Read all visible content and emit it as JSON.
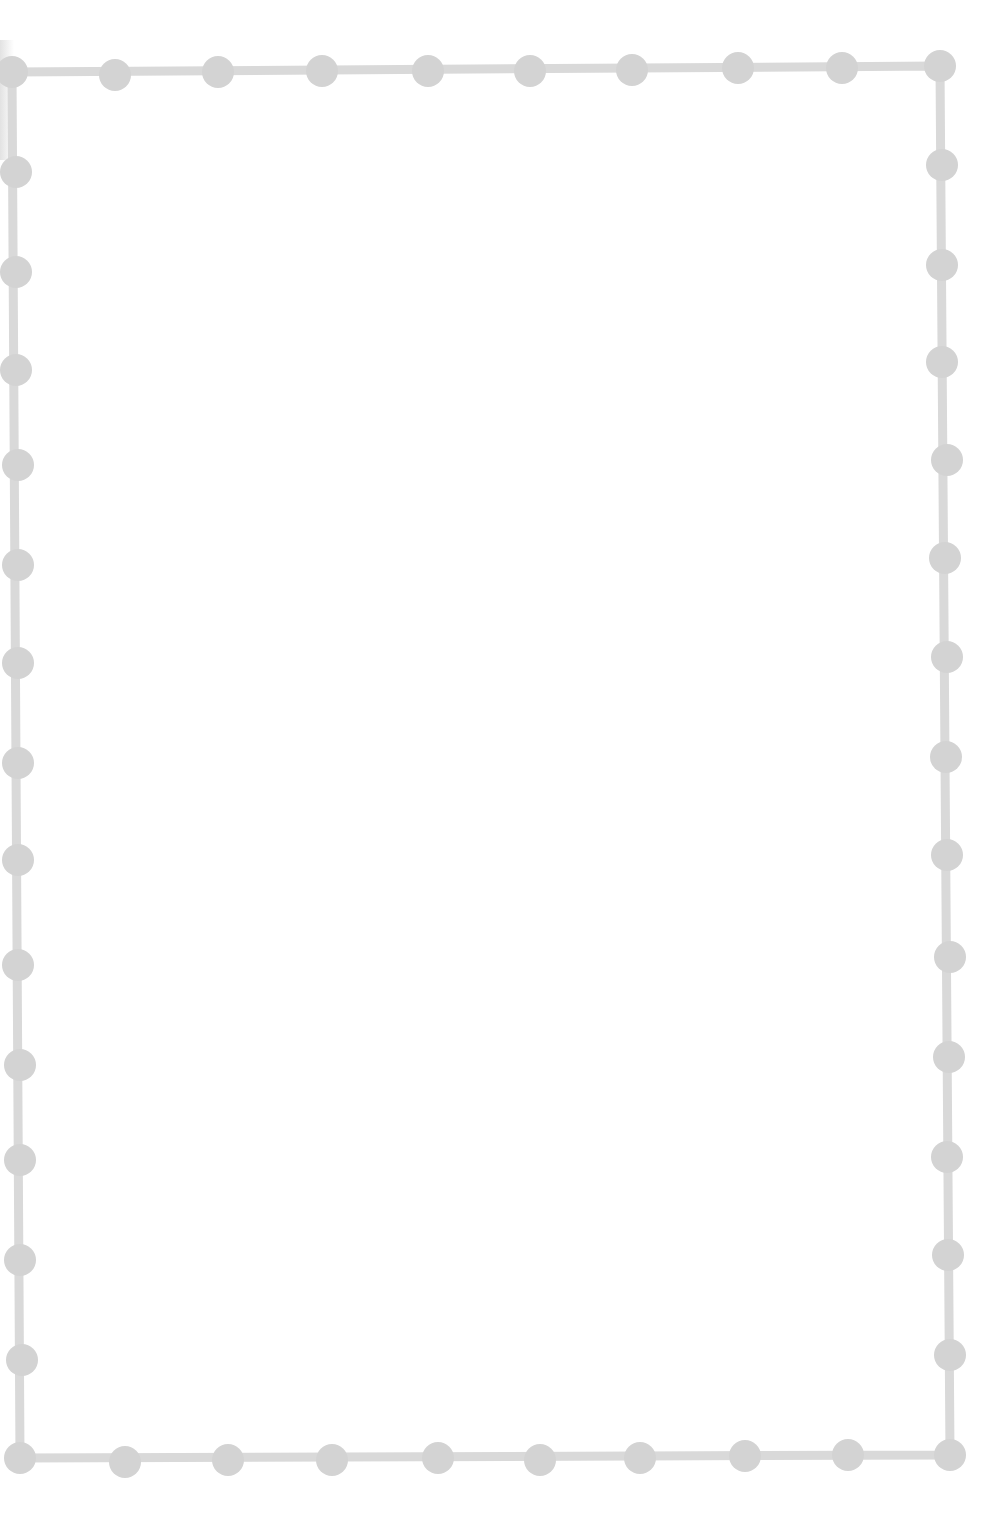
{
  "page": {
    "background": "#ffffff"
  },
  "border": {
    "color": "#d9d9d9",
    "bead_color": "#d3d3d3",
    "line_width": 9,
    "bead_radius": 16,
    "corners": {
      "top_left": [
        12,
        72
      ],
      "top_right": [
        940,
        66
      ],
      "bottom_right": [
        950,
        1455
      ],
      "bottom_left": [
        20,
        1458
      ]
    },
    "beads": {
      "top": [
        [
          115,
          75
        ],
        [
          218,
          72
        ],
        [
          322,
          71
        ],
        [
          428,
          71
        ],
        [
          530,
          71
        ],
        [
          632,
          70
        ],
        [
          738,
          68
        ],
        [
          842,
          68
        ]
      ],
      "right": [
        [
          942,
          165
        ],
        [
          942,
          265
        ],
        [
          942,
          362
        ],
        [
          947,
          460
        ],
        [
          945,
          558
        ],
        [
          947,
          657
        ],
        [
          946,
          757
        ],
        [
          947,
          855
        ],
        [
          950,
          957
        ],
        [
          949,
          1057
        ],
        [
          947,
          1157
        ],
        [
          948,
          1255
        ],
        [
          950,
          1355
        ]
      ],
      "left": [
        [
          16,
          172
        ],
        [
          16,
          272
        ],
        [
          16,
          370
        ],
        [
          18,
          465
        ],
        [
          18,
          565
        ],
        [
          18,
          663
        ],
        [
          18,
          763
        ],
        [
          18,
          860
        ],
        [
          18,
          965
        ],
        [
          20,
          1065
        ],
        [
          20,
          1160
        ],
        [
          20,
          1260
        ],
        [
          22,
          1360
        ]
      ],
      "bottom": [
        [
          125,
          1462
        ],
        [
          228,
          1460
        ],
        [
          332,
          1460
        ],
        [
          438,
          1458
        ],
        [
          540,
          1460
        ],
        [
          640,
          1458
        ],
        [
          745,
          1456
        ],
        [
          848,
          1455
        ]
      ]
    }
  }
}
